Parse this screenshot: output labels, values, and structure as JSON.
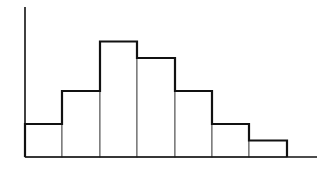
{
  "chart_data": {
    "type": "bar",
    "subtype": "histogram",
    "title": "",
    "xlabel": "",
    "ylabel": "",
    "categories": [
      "1",
      "2",
      "3",
      "4",
      "5",
      "6",
      "7"
    ],
    "values": [
      2,
      4,
      7,
      6,
      4,
      2,
      1
    ],
    "ylim": [
      0,
      9
    ],
    "grid": false,
    "legend": null,
    "tick_labels_visible": false,
    "colors": {
      "line": "#111111",
      "fill": "#ffffff",
      "inner_edge": "#555555"
    }
  },
  "layout": {
    "origin_x": 25,
    "baseline_y": 157,
    "axis_top_y": 7,
    "axis_end_x": 317,
    "bin_edges_px": [
      25,
      62,
      100,
      137,
      175,
      212,
      249,
      287
    ],
    "unit_px": 16.5
  }
}
